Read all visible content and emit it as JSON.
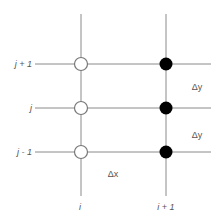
{
  "diagram": {
    "type": "finite-difference-grid",
    "colors": {
      "line": "#8a8a8a",
      "open_node_fill": "#ffffff",
      "open_node_stroke": "#777777",
      "filled_node": "#000000",
      "label": "#555555"
    },
    "row_labels": [
      {
        "id": "row-j-plus-1",
        "text": "j + 1"
      },
      {
        "id": "row-j",
        "text": "j"
      },
      {
        "id": "row-j-minus-1",
        "text": "j - 1"
      }
    ],
    "column_labels": [
      {
        "id": "col-i",
        "text": "i"
      },
      {
        "id": "col-i-plus-1",
        "text": "i + 1"
      }
    ],
    "spacing_labels": {
      "dy_upper": "Δy",
      "dy_lower": "Δy",
      "dx": "Δx"
    },
    "nodes": {
      "column_i": [
        "open",
        "open",
        "open"
      ],
      "column_i_plus_1": [
        "filled",
        "filled",
        "filled"
      ]
    }
  }
}
